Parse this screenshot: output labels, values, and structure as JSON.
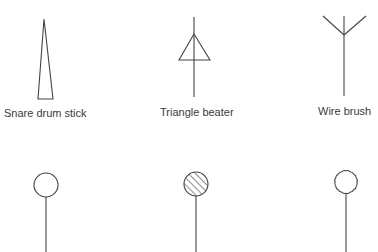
{
  "diagram": {
    "type": "percussion beater notation symbols",
    "line_color": "#444444",
    "background": "#ffffff",
    "row1": [
      {
        "id": "snare-drum-stick",
        "label": "Snare drum stick",
        "shape": "narrow-triangle"
      },
      {
        "id": "triangle-beater",
        "label": "Triangle beater",
        "shape": "triangle-on-stick"
      },
      {
        "id": "wire-brush",
        "label": "Wire brush",
        "shape": "fork-on-stick"
      }
    ],
    "row2": [
      {
        "id": "hollow-mallet",
        "label": "",
        "shape": "open-circle-on-stick"
      },
      {
        "id": "hatched-mallet",
        "label": "",
        "shape": "hatched-circle-on-stick"
      },
      {
        "id": "scalloped-mallet",
        "label": "",
        "shape": "scalloped-circle-on-stick"
      }
    ]
  }
}
